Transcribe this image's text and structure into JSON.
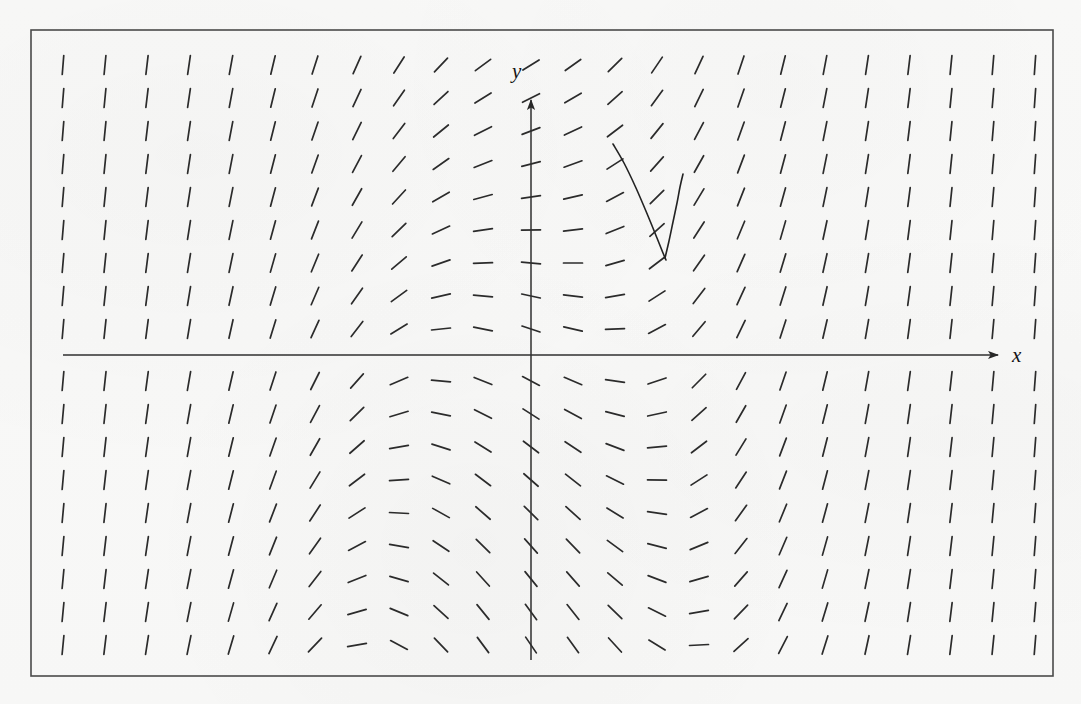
{
  "figure": {
    "kind": "slope-field",
    "title": "",
    "background_color": "#f8f8f7",
    "ink_color": "#2b2b2b",
    "frame": {
      "label": "plot-border",
      "x": 31,
      "y": 30,
      "width": 1022,
      "height": 646,
      "stroke": "#4a4a4a",
      "stroke_width": 1.6
    },
    "axes": {
      "origin_px": [
        531,
        355
      ],
      "x_axis": {
        "label": "x",
        "label_px": [
          1012,
          362
        ],
        "start_px": [
          63,
          355
        ],
        "end_px": [
          998,
          355
        ],
        "arrow": "right"
      },
      "y_axis": {
        "label": "y",
        "label_px": [
          518,
          78
        ],
        "start_px": [
          531,
          660
        ],
        "end_px": [
          531,
          100
        ],
        "arrow": "up"
      },
      "stroke": "#333333",
      "stroke_width": 1.5,
      "tick_labels": [],
      "grid": false
    }
  },
  "chart_data": {
    "type": "scatter",
    "subtype": "slope-field-with-solution-curve",
    "title": "",
    "xlabel": "x",
    "ylabel": "y",
    "xlim": [
      -11.5,
      11.5
    ],
    "ylim": [
      -7.5,
      7.5
    ],
    "grid": false,
    "legend": null,
    "tick_labels": {
      "x": [],
      "y": []
    },
    "slope_field": {
      "description": "Grid of short line segments showing dy/dx at sample points. Slope is negative (down-right) in the upper-left and lower-right regions and positive (up-right) in the lower-left and upper-right regions; segments flatten toward horizontal near the left and right of each sign band and steepen to near-vertical along the transition columns.",
      "model": "dy/dx = (x*x - 4) * 0.11 + y * 0.16",
      "segment_length_px": 19,
      "columns_px": [
        63,
        105,
        147,
        189,
        231,
        273,
        315,
        357,
        399,
        441,
        483,
        531,
        573,
        615,
        657,
        699,
        741,
        783,
        825,
        867,
        909,
        951,
        993,
        1035
      ],
      "rows_px": [
        65,
        98,
        131,
        164,
        197,
        230,
        263,
        296,
        329,
        381,
        414,
        447,
        480,
        513,
        546,
        579,
        612,
        645
      ],
      "sample_slopes_note": "Angles rendered as atan(slope) with vertical exaggeration; pure horizontal dashes appear in the column just right of the y-axis and along the mid bands."
    },
    "solution_curve": {
      "label": "particular-solution",
      "stroke": "#232323",
      "stroke_width": 1.6,
      "branches": [
        {
          "name": "left-branch",
          "points_px": [
            [
              613,
              144
            ],
            [
              624,
              163
            ],
            [
              636,
              188
            ],
            [
              648,
              216
            ],
            [
              657,
              238
            ],
            [
              663,
              253
            ],
            [
              666,
              260
            ]
          ]
        },
        {
          "name": "right-branch",
          "points_px": [
            [
              665,
              258
            ],
            [
              669,
              241
            ],
            [
              673,
              222
            ],
            [
              677,
              203
            ],
            [
              680,
              187
            ],
            [
              683,
              174
            ]
          ]
        }
      ],
      "vertex_px": [
        665,
        258
      ]
    }
  }
}
